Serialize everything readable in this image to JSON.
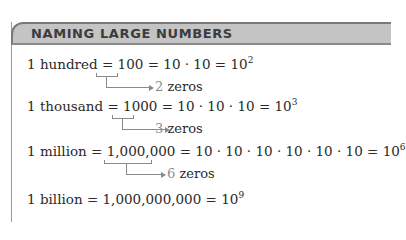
{
  "header": {
    "title": "NAMING LARGE NUMBERS"
  },
  "rows": [
    {
      "name": "1 hundred",
      "number": "100",
      "expansion": "10 · 10",
      "power_base": "10",
      "power_exp": "2",
      "zeros_count": "2",
      "zeros_label": "zeros"
    },
    {
      "name": "1 thousand",
      "number": "1000",
      "expansion": "10 · 10 · 10",
      "power_base": "10",
      "power_exp": "3",
      "zeros_count": "3",
      "zeros_label": "zeros"
    },
    {
      "name": "1 million",
      "number": "1,000,000",
      "expansion": "10 · 10 · 10 · 10 · 10 · 10",
      "power_base": "10",
      "power_exp": "6",
      "zeros_count": "6",
      "zeros_label": "zeros"
    },
    {
      "name": "1 billion",
      "number": "1,000,000,000",
      "power_base": "10",
      "power_exp": "9"
    }
  ],
  "symbols": {
    "equals": "="
  }
}
